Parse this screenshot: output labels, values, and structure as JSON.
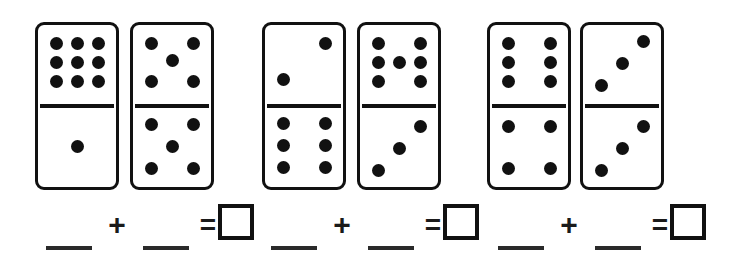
{
  "worksheet": {
    "title": "Domino Addition Worksheet",
    "background_color": "#ffffff",
    "ink_color": "#111111"
  },
  "dominoes": [
    {
      "id": "domino-1",
      "top_pips": 9,
      "bottom_pips": 1,
      "total": 10,
      "top_layout": "3x3-grid",
      "bottom_layout": "center"
    },
    {
      "id": "domino-2",
      "top_pips": 5,
      "bottom_pips": 5,
      "total": 10,
      "top_layout": "corners-center",
      "bottom_layout": "corners-center"
    },
    {
      "id": "domino-3",
      "top_pips": 2,
      "bottom_pips": 6,
      "total": 8,
      "top_layout": "anti-diagonal",
      "bottom_layout": "2x3-grid"
    },
    {
      "id": "domino-4",
      "top_pips": 7,
      "bottom_pips": 3,
      "total": 10,
      "top_layout": "2x3-grid-center",
      "bottom_layout": "anti-diagonal"
    },
    {
      "id": "domino-5",
      "top_pips": 6,
      "bottom_pips": 4,
      "total": 10,
      "top_layout": "2x3-grid",
      "bottom_layout": "corners"
    },
    {
      "id": "domino-6",
      "top_pips": 3,
      "bottom_pips": 3,
      "total": 6,
      "top_layout": "anti-diagonal",
      "bottom_layout": "anti-diagonal"
    }
  ],
  "equations": [
    {
      "id": "equation-1",
      "addend_1": "",
      "addend_2": "",
      "sum": "",
      "plus_symbol": "+",
      "equals_symbol": "=",
      "blank_placeholder": "",
      "answer_placeholder": ""
    },
    {
      "id": "equation-2",
      "addend_1": "",
      "addend_2": "",
      "sum": "",
      "plus_symbol": "+",
      "equals_symbol": "=",
      "blank_placeholder": "",
      "answer_placeholder": ""
    },
    {
      "id": "equation-3",
      "addend_1": "",
      "addend_2": "",
      "sum": "",
      "plus_symbol": "+",
      "equals_symbol": "=",
      "blank_placeholder": "",
      "answer_placeholder": ""
    }
  ]
}
